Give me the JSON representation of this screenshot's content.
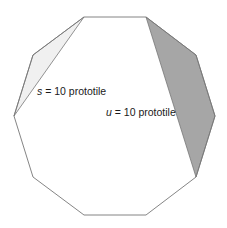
{
  "diagram": {
    "shape": "regular decagon",
    "outline_color": "#777777",
    "vertices": [
      [
        84,
        17
      ],
      [
        146,
        17
      ],
      [
        196,
        55
      ],
      [
        215,
        116
      ],
      [
        196,
        177
      ],
      [
        146,
        215
      ],
      [
        84,
        215
      ],
      [
        33,
        177
      ],
      [
        14,
        116
      ],
      [
        33,
        55
      ]
    ],
    "prototiles": [
      {
        "id": "s",
        "variable": "s",
        "label_rest": " = 10 prototile",
        "fill": "#f0f0f0",
        "points": [
          [
            84,
            17
          ],
          [
            33,
            55
          ],
          [
            14,
            116
          ]
        ]
      },
      {
        "id": "u",
        "variable": "u",
        "label_rest": " = 10 prototile",
        "fill": "#a6a6a6",
        "points": [
          [
            146,
            17
          ],
          [
            196,
            55
          ],
          [
            215,
            116
          ],
          [
            196,
            177
          ]
        ]
      }
    ]
  }
}
